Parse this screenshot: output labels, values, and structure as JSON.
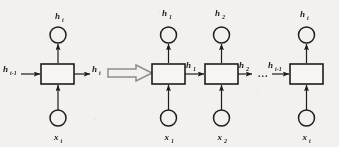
{
  "figure": {
    "background_color": "#f2f1ef",
    "ink_color": "#1d1d1d",
    "transform_symbol": "double-right-arrow",
    "ellipsis": "..."
  },
  "folded": {
    "cell_label": "",
    "output_node": {
      "base": "h",
      "sub": "t"
    },
    "input_node": {
      "base": "x",
      "sub": "t"
    },
    "state_in": {
      "base": "h",
      "sub": "t-1"
    },
    "state_out": {
      "base": "h",
      "sub": "t"
    }
  },
  "unrolled": {
    "steps": [
      {
        "output_node": {
          "base": "h",
          "sub": "1"
        },
        "input_node": {
          "base": "x",
          "sub": "1"
        },
        "state_out": {
          "base": "h",
          "sub": "1"
        }
      },
      {
        "output_node": {
          "base": "h",
          "sub": "2"
        },
        "input_node": {
          "base": "x",
          "sub": "2"
        },
        "state_out": {
          "base": "h",
          "sub": "2"
        }
      },
      {
        "output_node": {
          "base": "h",
          "sub": "t"
        },
        "input_node": {
          "base": "x",
          "sub": "t"
        },
        "state_in": {
          "base": "h",
          "sub": "t-1"
        }
      }
    ]
  }
}
